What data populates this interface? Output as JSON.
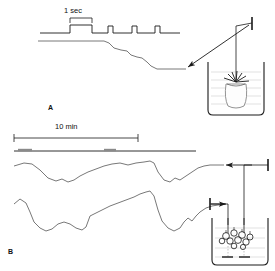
{
  "figure": {
    "type": "scientific-recording-diagram",
    "background": "#ffffff",
    "ink": "#1a1a1a",
    "panels": [
      {
        "id": "A",
        "label": "A",
        "label_pos": {
          "x": 48,
          "y": 104
        },
        "scale_bar": {
          "label": "1 sec",
          "label_pos": {
            "x": 64,
            "y": 6
          },
          "x1": 70,
          "x2": 92,
          "y": 18
        },
        "description": "Fast contraction response of a single sea anemone recorded with a force transducer; upper trace is the electrical stimulus pulse train, lower trace is the mechanical response.",
        "stimulus_trace": {
          "name": "stimulus-pulse-train",
          "baseline_y": 33,
          "pulse_high_y": 25,
          "x_start": 40,
          "x_end": 180,
          "pulses": [
            {
              "x_on": 70,
              "x_off": 92,
              "width": "wide"
            },
            {
              "x_on": 108,
              "x_off": 113,
              "width": "narrow"
            },
            {
              "x_on": 132,
              "x_off": 137,
              "width": "narrow"
            },
            {
              "x_on": 155,
              "x_off": 160,
              "width": "narrow"
            }
          ]
        },
        "response_trace": {
          "name": "contraction-response-trace",
          "points": "38,41 105,41 112,47 120,50 128,53 133,57 139,58 148,62 152,67 158,69 185,69"
        },
        "arrow": {
          "from": {
            "x": 248,
            "y": 24
          },
          "to": {
            "x": 186,
            "y": 68
          }
        },
        "transducer": {
          "x": 252,
          "y": 20,
          "label": ""
        },
        "beaker": {
          "x": 208,
          "y": 62,
          "w": 56,
          "h": 52,
          "contents": "single-sea-anemone",
          "water_lines": 5,
          "thread_x": 236
        }
      },
      {
        "id": "B",
        "label": "B",
        "label_pos": {
          "x": 8,
          "y": 248
        },
        "scale_bar": {
          "label": "10 min",
          "label_pos": {
            "x": 55,
            "y": 122
          },
          "x1": 14,
          "x2": 138,
          "y": 138
        },
        "description": "Slow rhythmic activity of a coral colony recorded simultaneously by two force transducers over a ten minute time base; event marker line lies beneath the scale bar.",
        "event_line": {
          "name": "event-marker-line",
          "x1": 14,
          "x2": 196,
          "y": 151,
          "markers": [
            {
              "x": 18,
              "w": 14,
              "text": ""
            },
            {
              "x": 104,
              "w": 12,
              "text": ""
            }
          ]
        },
        "traces": [
          {
            "name": "colony-trace-upper",
            "points": "14,166 24,163 32,164 40,170 48,178 56,181 62,179 68,182 74,180 80,176 88,172 96,169 104,166 112,164 120,163 128,165 136,163 144,162 150,161 154,163 158,172 164,180 170,182 175,178 180,180 186,176 192,172 198,168 204,166 210,165 216,165 222,165"
          },
          {
            "name": "colony-trace-lower",
            "points": "14,204 20,199 26,203 30,212 34,222 40,228 46,231 52,229 58,224 64,222 70,224 76,228 82,230 86,227 90,216 96,213 102,210 110,206 118,203 126,200 134,197 140,194 146,192 150,191 154,196 158,210 162,221 168,228 174,231 180,228 184,222 188,218 192,221 196,216 200,212 206,208 212,206 218,205 224,205"
          }
        ],
        "arrows": [
          {
            "from": {
              "x": 252,
              "y": 165
            },
            "to": {
              "x": 226,
              "y": 165
            }
          },
          {
            "from": {
              "x": 212,
              "y": 204
            },
            "to": {
              "x": 227,
              "y": 204
            }
          }
        ],
        "transducers": [
          {
            "x": 268,
            "y": 162,
            "orientation": "vertical"
          },
          {
            "x": 210,
            "y": 201,
            "orientation": "vertical"
          }
        ],
        "beaker": {
          "x": 212,
          "y": 218,
          "w": 56,
          "h": 48,
          "contents": "coral-colony",
          "water_lines": 4,
          "thread_x": [
            228,
            244
          ],
          "anchor_pins": 2
        }
      }
    ]
  }
}
